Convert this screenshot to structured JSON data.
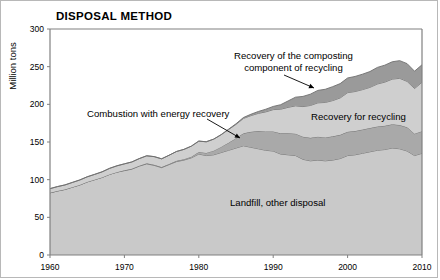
{
  "chart": {
    "title": "DISPOSAL METHOD",
    "ylabel": "Million tons"
  },
  "annotations": {
    "composting_line1": "Recovery of the composting",
    "composting_line2": "component of recycling",
    "recycling": "Recovery for recycling",
    "combustion": "Combustion with energy recovery",
    "landfill": "Landfill, other disposal"
  },
  "colors": {
    "landfill": "#c9c9c9",
    "combustion": "#a9a9a9",
    "recycling": "#cfcfcf",
    "composting": "#9a9a9a",
    "axis": "#808080",
    "outline": "#6e6e6e"
  },
  "chart_data": {
    "type": "area",
    "title": "DISPOSAL METHOD",
    "xlabel": "",
    "ylabel": "Million tons",
    "xlim": [
      1960,
      2010
    ],
    "ylim": [
      0,
      300
    ],
    "xticks": [
      1960,
      1970,
      1980,
      1990,
      2000,
      2010
    ],
    "yticks": [
      0,
      50,
      100,
      150,
      200,
      250,
      300
    ],
    "grid": false,
    "stacked": true,
    "legend_position": "inline-annotations",
    "x": [
      1960,
      1961,
      1962,
      1963,
      1964,
      1965,
      1966,
      1967,
      1968,
      1969,
      1970,
      1971,
      1972,
      1973,
      1974,
      1975,
      1976,
      1977,
      1978,
      1979,
      1980,
      1981,
      1982,
      1983,
      1984,
      1985,
      1986,
      1987,
      1988,
      1989,
      1990,
      1991,
      1992,
      1993,
      1994,
      1995,
      1996,
      1997,
      1998,
      1999,
      2000,
      2001,
      2002,
      2003,
      2004,
      2005,
      2006,
      2007,
      2008,
      2009,
      2010
    ],
    "series": [
      {
        "name": "Landfill, other disposal",
        "values": [
          82.5,
          85,
          87,
          90,
          93,
          97,
          100,
          103,
          107,
          110,
          112,
          114,
          118,
          121,
          119,
          116,
          120,
          124,
          126,
          129,
          134,
          132,
          133,
          136,
          139,
          142,
          145,
          143,
          141,
          139,
          138,
          134,
          133,
          132,
          127,
          125,
          126,
          125,
          126,
          128,
          132,
          133,
          135,
          137,
          139,
          140,
          142,
          141,
          138,
          132,
          135
        ]
      },
      {
        "name": "Combustion with energy recovery",
        "values": [
          0,
          0,
          0,
          0,
          0,
          0,
          0,
          0,
          0,
          0,
          0.4,
          0.5,
          0.6,
          0.7,
          0.8,
          0.7,
          0.8,
          1.0,
          1.2,
          1.5,
          2.7,
          3.5,
          5.5,
          7.5,
          10.0,
          13.0,
          16.5,
          20.5,
          23.5,
          25.0,
          26.0,
          27.5,
          28.5,
          29.0,
          30.0,
          30.5,
          31.0,
          31.0,
          31.5,
          31.5,
          31.5,
          31.5,
          31.5,
          31.5,
          31.5,
          31.5,
          31.5,
          31.5,
          31.5,
          29.0,
          29.3
        ]
      },
      {
        "name": "Recovery for recycling",
        "values": [
          5.6,
          5.8,
          6.0,
          6.3,
          6.6,
          6.8,
          7.0,
          7.4,
          8.0,
          8.4,
          8.6,
          9.0,
          9.4,
          10.0,
          10.8,
          11.0,
          11.6,
          12.4,
          13.0,
          14.0,
          14.5,
          14.8,
          15.3,
          16.2,
          17.5,
          18.4,
          19.8,
          21.5,
          23.5,
          26.0,
          29.0,
          32.0,
          34.5,
          37.0,
          40.0,
          43.0,
          45.0,
          46.5,
          47.5,
          49.0,
          52.0,
          52.5,
          53.0,
          54.0,
          56.5,
          58.0,
          60.0,
          62.0,
          61.0,
          60.0,
          65.0
        ]
      },
      {
        "name": "Recovery of the composting component of recycling",
        "values": [
          0,
          0,
          0,
          0,
          0,
          0,
          0,
          0,
          0,
          0,
          0,
          0,
          0,
          0,
          0,
          0,
          0,
          0,
          0,
          0,
          0,
          0,
          0,
          0,
          0.5,
          0.8,
          1.2,
          1.8,
          2.5,
          3.5,
          4.2,
          6.0,
          8.5,
          11.5,
          13.5,
          15.0,
          16.5,
          17.5,
          18.5,
          19.0,
          19.5,
          20.0,
          20.5,
          21.0,
          22.0,
          22.5,
          23.0,
          23.5,
          23.5,
          23.0,
          23.2
        ]
      }
    ]
  }
}
